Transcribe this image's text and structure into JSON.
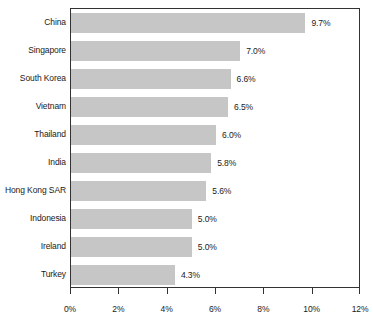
{
  "chart_data": {
    "type": "bar",
    "orientation": "horizontal",
    "title": "",
    "subtitle": "",
    "xlabel": "",
    "ylabel": "",
    "xlim": [
      0,
      12
    ],
    "xtick_labels": [
      "0%",
      "2%",
      "4%",
      "6%",
      "8%",
      "10%",
      "12%"
    ],
    "xticks": [
      0,
      2,
      4,
      6,
      8,
      10,
      12
    ],
    "grid": false,
    "legend": null,
    "categories": [
      "China",
      "Singapore",
      "South Korea",
      "Vietnam",
      "Thailand",
      "India",
      "Hong Kong SAR",
      "Indonesia",
      "Ireland",
      "Turkey"
    ],
    "values": [
      9.7,
      7.0,
      6.6,
      6.5,
      6.0,
      5.8,
      5.6,
      5.0,
      5.0,
      4.3
    ],
    "value_labels": [
      "9.7%",
      "7.0%",
      "6.6%",
      "6.5%",
      "6.0%",
      "5.8%",
      "5.6%",
      "5.0%",
      "5.0%",
      "4.3%"
    ],
    "bar_color": "#c6c6c6",
    "axis_color": "#333333",
    "text_color": "#1a1a1a",
    "background_color": "#ffffff"
  }
}
